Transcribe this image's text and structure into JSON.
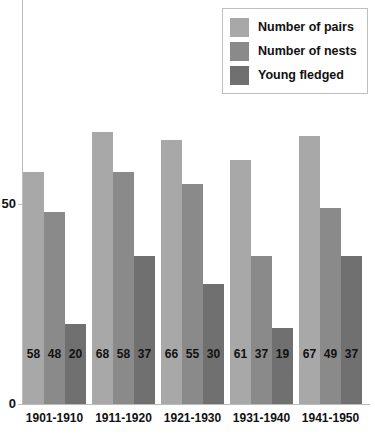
{
  "chart_data": {
    "type": "bar",
    "title": "",
    "xlabel": "",
    "ylabel": "",
    "categories": [
      "1901-1910",
      "1911-1920",
      "1921-1930",
      "1931-1940",
      "1941-1950"
    ],
    "series": [
      {
        "name": "Number of pairs",
        "color": "#a8a8a8",
        "values": [
          58,
          68,
          66,
          61,
          67
        ]
      },
      {
        "name": "Number of nests",
        "color": "#8a8a8a",
        "values": [
          48,
          58,
          55,
          37,
          49
        ]
      },
      {
        "name": "Young fledged",
        "color": "#707070",
        "values": [
          20,
          37,
          30,
          19,
          37
        ]
      }
    ],
    "ylim": [
      0,
      101
    ],
    "yticks": [
      0,
      50
    ],
    "ytick_labels": [
      "0",
      "50"
    ],
    "grid": false,
    "legend_position": "top-right",
    "data_labels_shown": true
  },
  "legend": {
    "items": [
      {
        "label": "Number of pairs"
      },
      {
        "label": "Number of nests"
      },
      {
        "label": "Young fledged"
      }
    ]
  },
  "axis": {
    "y_tick_0": "0",
    "y_tick_50": "50"
  }
}
